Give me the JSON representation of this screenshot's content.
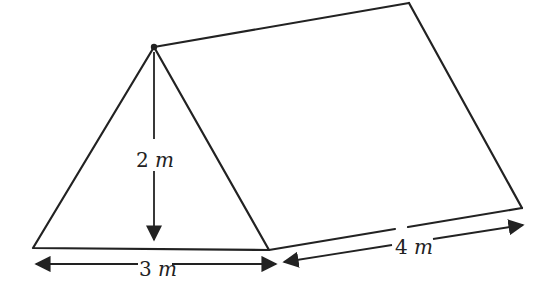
{
  "diagram": {
    "type": "triangular-prism",
    "colors": {
      "stroke": "#222222",
      "background": "#ffffff"
    },
    "dimensions": {
      "height": {
        "value": "2",
        "unit": "m"
      },
      "base": {
        "value": "3",
        "unit": "m"
      },
      "length": {
        "value": "4",
        "unit": "m"
      }
    },
    "vertices": {
      "apex": [
        154,
        47
      ],
      "base_left": [
        33,
        248
      ],
      "base_right": [
        269,
        250
      ],
      "back_top": [
        409,
        3
      ],
      "back_bottom": [
        522,
        208
      ]
    }
  }
}
